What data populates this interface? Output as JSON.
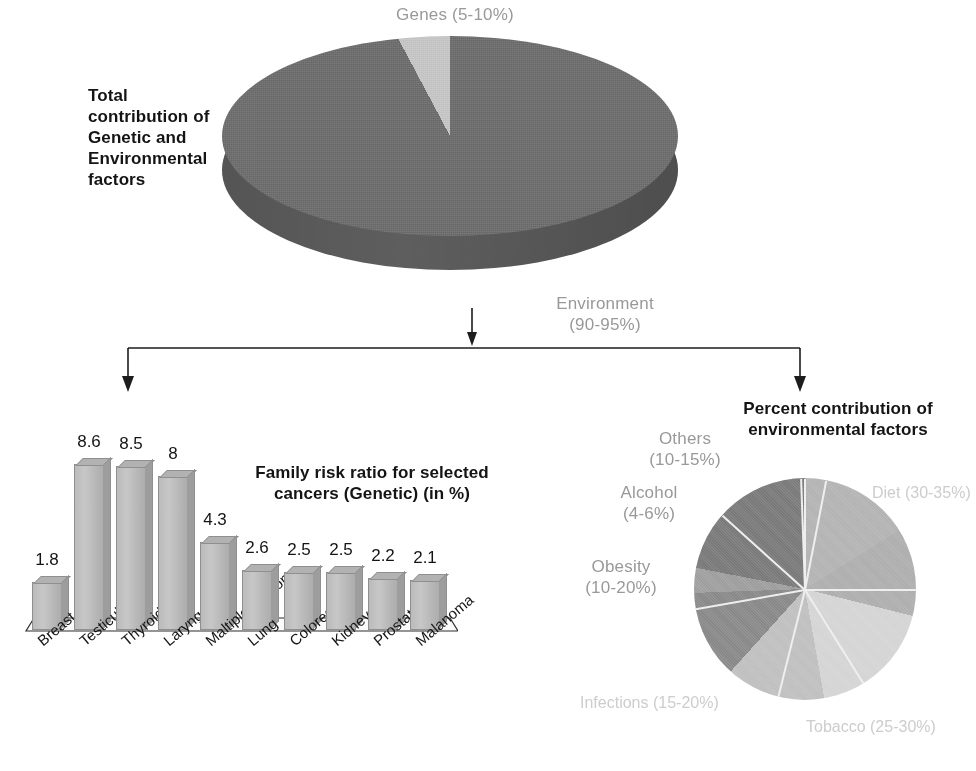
{
  "figure": {
    "title_left": "Total\ncontribution of\nGenetic and\nEnvironmental\nfactors",
    "title_bars": "Family risk ratio for selected\ncancers (Genetic) (in %)",
    "title_env": "Percent contribution of\nenvironmental factors"
  },
  "top_pie_labels": {
    "genes": "Genes (5-10%)",
    "environment": "Environment\n(90-95%)"
  },
  "env_pie_labels": {
    "others": "Others\n(10-15%)",
    "alcohol": "Alcohol\n(4-6%)",
    "obesity": "Obesity\n(10-20%)",
    "infections": "Infections\n(15-20%)",
    "tobacco": "Tobacco\n(25-30%)",
    "diet": "Diet\n(30-35%)"
  },
  "colors": {
    "environment_slice": "#6f6f6f",
    "genes_slice": "#c8c8c8",
    "pie_side": "#5d5d5d",
    "bar_face": "#c9c9c9",
    "label_gray": "#9a9a9a",
    "text_black": "#111111"
  },
  "chart_data": [
    {
      "type": "pie",
      "title": "Total contribution of Genetic and Environmental factors",
      "labels": [
        "Genes (5-10%)",
        "Environment (90-95%)"
      ],
      "values": [
        7.5,
        92.5
      ],
      "value_ranges": [
        [
          5,
          10
        ],
        [
          90,
          95
        ]
      ],
      "legend": "labels outside slices",
      "three_d": true
    },
    {
      "type": "bar",
      "title": "Family risk ratio for selected cancers (Genetic) (in %)",
      "categories": [
        "Breast",
        "Testicular",
        "Thyroid",
        "Laryngeal",
        "Maltiple myeloma",
        "Lung",
        "Colorectal",
        "Kidney",
        "Prostate",
        "Malanoma"
      ],
      "values": [
        1.8,
        8.6,
        8.5,
        8,
        4.3,
        2.6,
        2.5,
        2.5,
        2.2,
        2.1
      ],
      "xlabel": "",
      "ylabel": "",
      "ylim": [
        0,
        9
      ],
      "grid": false,
      "data_labels": true,
      "three_d": true
    },
    {
      "type": "pie",
      "title": "Percent contribution of environmental factors",
      "labels": [
        "Diet (30-35%)",
        "Tobacco (25-30%)",
        "Infections (15-20%)",
        "Obesity (10-20%)",
        "Alcohol (4-6%)",
        "Others (10-15%)"
      ],
      "values": [
        32.5,
        27.5,
        17.5,
        15,
        5,
        12.5
      ],
      "value_ranges": [
        [
          30,
          35
        ],
        [
          25,
          30
        ],
        [
          15,
          20
        ],
        [
          10,
          20
        ],
        [
          4,
          6
        ],
        [
          10,
          15
        ]
      ],
      "legend": "labels outside slices",
      "three_d": false
    }
  ],
  "bars": [
    {
      "label": "Breast",
      "value": "1.8",
      "h": 48
    },
    {
      "label": "Testicular",
      "value": "8.6",
      "h": 166
    },
    {
      "label": "Thyroid",
      "value": "8.5",
      "h": 164
    },
    {
      "label": "Laryngeal",
      "value": "8",
      "h": 154
    },
    {
      "label": "Maltiple myeloma",
      "value": "4.3",
      "h": 88
    },
    {
      "label": "Lung",
      "value": "2.6",
      "h": 60
    },
    {
      "label": "Colorectal",
      "value": "2.5",
      "h": 58
    },
    {
      "label": "Kidney",
      "value": "2.5",
      "h": 58
    },
    {
      "label": "Prostate",
      "value": "2.2",
      "h": 52
    },
    {
      "label": "Malanoma",
      "value": "2.1",
      "h": 50
    }
  ]
}
